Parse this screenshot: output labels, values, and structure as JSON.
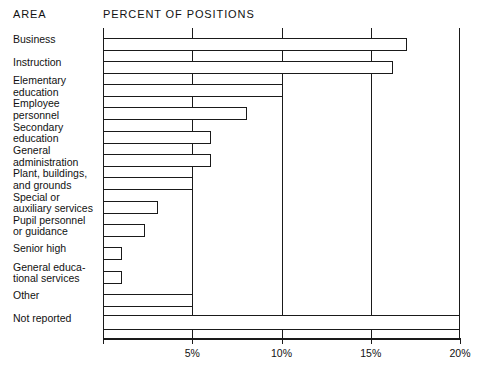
{
  "headers": {
    "area": "AREA",
    "percent": "PERCENT OF POSITIONS"
  },
  "chart_data": {
    "type": "bar",
    "orientation": "horizontal",
    "title": "PERCENT OF POSITIONS",
    "xlabel": "",
    "ylabel": "AREA",
    "xlim": [
      0,
      20
    ],
    "xticks": [
      0,
      5,
      10,
      15,
      20
    ],
    "xtick_labels": [
      "",
      "5%",
      "10%",
      "15%",
      "20%"
    ],
    "grid": true,
    "grid_axis": "x",
    "legend": "none",
    "bar_style": {
      "fill": "#ffffff",
      "edge": "#1a1a1a"
    },
    "categories": [
      "Business",
      "Instruction",
      "Elementary education",
      "Employee personnel",
      "Secondary education",
      "General administration",
      "Plant, buildings, and grounds",
      "Special or auxiliary services",
      "Pupil personnel or guidance",
      "Senior high",
      "General educational services",
      "Other",
      "Not reported"
    ],
    "values": [
      17.0,
      16.2,
      10.0,
      8.0,
      6.0,
      6.0,
      5.0,
      3.0,
      2.3,
      1.0,
      1.0,
      5.0,
      20.0
    ]
  },
  "rows": [
    {
      "label_lines": [
        "Business"
      ],
      "value": 17.0
    },
    {
      "label_lines": [
        "Instruction"
      ],
      "value": 16.2
    },
    {
      "label_lines": [
        "Elementary",
        "education"
      ],
      "value": 10.0
    },
    {
      "label_lines": [
        "Employee",
        "personnel"
      ],
      "value": 8.0
    },
    {
      "label_lines": [
        "Secondary",
        "education"
      ],
      "value": 6.0
    },
    {
      "label_lines": [
        "General",
        "administration"
      ],
      "value": 6.0
    },
    {
      "label_lines": [
        "Plant, buildings,",
        "and grounds"
      ],
      "value": 5.0
    },
    {
      "label_lines": [
        "Special or",
        "auxiliary services"
      ],
      "value": 3.0
    },
    {
      "label_lines": [
        "Pupil personnel",
        "or guidance"
      ],
      "value": 2.3
    },
    {
      "label_lines": [
        "Senior high"
      ],
      "value": 1.0
    },
    {
      "label_lines": [
        "General educa-",
        "tional services"
      ],
      "value": 1.0
    },
    {
      "label_lines": [
        "Other"
      ],
      "value": 5.0
    },
    {
      "label_lines": [
        "Not reported"
      ],
      "value": 20.0
    }
  ],
  "axis": {
    "ticks": [
      {
        "value": 0,
        "label": ""
      },
      {
        "value": 5,
        "label": "5%"
      },
      {
        "value": 10,
        "label": "10%"
      },
      {
        "value": 15,
        "label": "15%"
      },
      {
        "value": 20,
        "label": "20%"
      }
    ]
  }
}
